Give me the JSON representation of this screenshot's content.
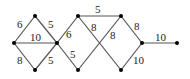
{
  "graph": {
    "nodes": [
      {
        "id": "A",
        "x": 14,
        "y": 43
      },
      {
        "id": "B",
        "x": 35,
        "y": 16
      },
      {
        "id": "C",
        "x": 35,
        "y": 70
      },
      {
        "id": "D",
        "x": 57,
        "y": 43
      },
      {
        "id": "E",
        "x": 78,
        "y": 16
      },
      {
        "id": "F",
        "x": 78,
        "y": 70
      },
      {
        "id": "G",
        "x": 121,
        "y": 16
      },
      {
        "id": "H",
        "x": 121,
        "y": 70
      },
      {
        "id": "I",
        "x": 142,
        "y": 43
      },
      {
        "id": "J",
        "x": 177,
        "y": 43
      }
    ],
    "edges": [
      {
        "from": "A",
        "to": "B",
        "weight": "6",
        "lx": 17,
        "ly": 28
      },
      {
        "from": "B",
        "to": "D",
        "weight": "5",
        "lx": 48,
        "ly": 28
      },
      {
        "from": "A",
        "to": "D",
        "weight": "10",
        "lx": 30,
        "ly": 41
      },
      {
        "from": "A",
        "to": "C",
        "weight": "8",
        "lx": 17,
        "ly": 64
      },
      {
        "from": "C",
        "to": "D",
        "weight": "5",
        "lx": 48,
        "ly": 64
      },
      {
        "from": "D",
        "to": "E",
        "weight": "6",
        "lx": 66,
        "ly": 38
      },
      {
        "from": "D",
        "to": "F",
        "weight": "5",
        "lx": 70,
        "ly": 58
      },
      {
        "from": "E",
        "to": "G",
        "weight": "5",
        "lx": 95,
        "ly": 13
      },
      {
        "from": "E",
        "to": "H",
        "weight": "8",
        "lx": 91,
        "ly": 31
      },
      {
        "from": "F",
        "to": "G",
        "weight": "8",
        "lx": 110,
        "ly": 39
      },
      {
        "from": "G",
        "to": "I",
        "weight": "8",
        "lx": 134,
        "ly": 30
      },
      {
        "from": "H",
        "to": "I",
        "weight": "10",
        "lx": 133,
        "ly": 64
      },
      {
        "from": "I",
        "to": "J",
        "weight": "10",
        "lx": 155,
        "ly": 41
      }
    ]
  }
}
